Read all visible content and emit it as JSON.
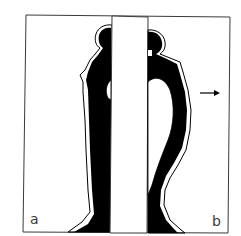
{
  "figure": {
    "panels": [
      {
        "id": "a",
        "label": "a",
        "description": "upright standing silhouette"
      },
      {
        "id": "b",
        "label": "b",
        "description": "bent silhouette leaning forward"
      }
    ],
    "arrow": {
      "direction": "right",
      "icon": "arrow-right-icon"
    },
    "colors": {
      "ink": "#000000",
      "paper": "#ffffff",
      "frame": "#3a3a3a"
    }
  }
}
